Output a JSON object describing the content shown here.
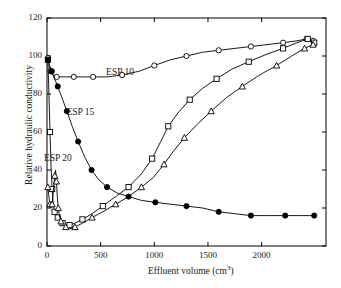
{
  "chart_data": {
    "type": "line",
    "title": "",
    "xlabel": "Effluent volume (cm3)",
    "xlabel_parts": {
      "base": "Effluent volume (cm",
      "sup": "3",
      "tail": ")"
    },
    "ylabel": "Relative hydraulic conductivity",
    "xlim": [
      0,
      2600
    ],
    "ylim": [
      0,
      120
    ],
    "xticks": [
      0,
      500,
      1000,
      1500,
      2000
    ],
    "xtick_labels": [
      "0",
      "500",
      "1000",
      "1500",
      "2000"
    ],
    "yticks": [
      0,
      20,
      40,
      60,
      80,
      100,
      120
    ],
    "ytick_labels": [
      "0",
      "20",
      "40",
      "60",
      "80",
      "100",
      "120"
    ],
    "grid": false,
    "legend_position": "inline-annotations",
    "annotations": [
      {
        "text": "ESP 10",
        "x": 700,
        "y": 91
      },
      {
        "text": "ESP 15",
        "x": 330,
        "y": 70
      },
      {
        "text": "ESP 20",
        "x": 120,
        "y": 46
      }
    ],
    "series": [
      {
        "name": "ESP 10",
        "marker": "circle-open",
        "points": [
          [
            10,
            99
          ],
          [
            20,
            95
          ],
          [
            32,
            92
          ],
          [
            55,
            90
          ],
          [
            90,
            89
          ],
          [
            150,
            89
          ],
          [
            250,
            89
          ],
          [
            340,
            89
          ],
          [
            430,
            89
          ],
          [
            560,
            89
          ],
          [
            700,
            90
          ],
          [
            860,
            92
          ],
          [
            1000,
            95
          ],
          [
            1150,
            98
          ],
          [
            1300,
            100
          ],
          [
            1450,
            102
          ],
          [
            1600,
            103
          ],
          [
            1750,
            104
          ],
          [
            1900,
            105
          ],
          [
            2050,
            106
          ],
          [
            2200,
            107
          ],
          [
            2330,
            108
          ],
          [
            2420,
            109
          ],
          [
            2480,
            108
          ]
        ]
      },
      {
        "name": "ESP 15",
        "marker": "square-open",
        "points": [
          [
            8,
            98
          ],
          [
            18,
            80
          ],
          [
            28,
            60
          ],
          [
            38,
            42
          ],
          [
            48,
            30
          ],
          [
            58,
            22
          ],
          [
            70,
            18
          ],
          [
            85,
            16
          ],
          [
            100,
            15
          ],
          [
            120,
            14
          ],
          [
            145,
            12
          ],
          [
            175,
            11
          ],
          [
            210,
            11
          ],
          [
            260,
            12
          ],
          [
            330,
            14
          ],
          [
            420,
            17
          ],
          [
            520,
            21
          ],
          [
            640,
            26
          ],
          [
            760,
            31
          ],
          [
            880,
            38
          ],
          [
            980,
            46
          ],
          [
            1060,
            55
          ],
          [
            1130,
            63
          ],
          [
            1220,
            70
          ],
          [
            1330,
            77
          ],
          [
            1450,
            83
          ],
          [
            1580,
            88
          ],
          [
            1720,
            93
          ],
          [
            1880,
            97
          ],
          [
            2050,
            101
          ],
          [
            2200,
            104
          ],
          [
            2330,
            107
          ],
          [
            2430,
            109
          ],
          [
            2490,
            107
          ]
        ]
      },
      {
        "name": "ESP 20",
        "marker": "triangle-open",
        "points": [
          [
            8,
            31
          ],
          [
            16,
            27
          ],
          [
            26,
            22
          ],
          [
            36,
            20
          ],
          [
            48,
            22
          ],
          [
            60,
            30
          ],
          [
            72,
            37
          ],
          [
            80,
            40
          ],
          [
            88,
            34
          ],
          [
            96,
            26
          ],
          [
            105,
            20
          ],
          [
            115,
            16
          ],
          [
            130,
            13
          ],
          [
            150,
            11
          ],
          [
            175,
            10
          ],
          [
            210,
            9
          ],
          [
            260,
            10
          ],
          [
            330,
            12
          ],
          [
            420,
            15
          ],
          [
            520,
            18
          ],
          [
            640,
            22
          ],
          [
            760,
            26
          ],
          [
            880,
            31
          ],
          [
            990,
            36
          ],
          [
            1090,
            43
          ],
          [
            1180,
            50
          ],
          [
            1280,
            57
          ],
          [
            1400,
            64
          ],
          [
            1530,
            71
          ],
          [
            1670,
            78
          ],
          [
            1820,
            84
          ],
          [
            1980,
            90
          ],
          [
            2140,
            95
          ],
          [
            2280,
            100
          ],
          [
            2400,
            104
          ],
          [
            2480,
            106
          ]
        ]
      },
      {
        "name": "filled-circle decline",
        "marker": "circle-filled",
        "points": [
          [
            10,
            98
          ],
          [
            25,
            95
          ],
          [
            45,
            92
          ],
          [
            70,
            88
          ],
          [
            100,
            84
          ],
          [
            140,
            78
          ],
          [
            185,
            71
          ],
          [
            235,
            63
          ],
          [
            290,
            55
          ],
          [
            350,
            47
          ],
          [
            415,
            40
          ],
          [
            480,
            35
          ],
          [
            560,
            31
          ],
          [
            650,
            28
          ],
          [
            760,
            26
          ],
          [
            880,
            24
          ],
          [
            1010,
            23
          ],
          [
            1150,
            22
          ],
          [
            1300,
            21
          ],
          [
            1450,
            20
          ],
          [
            1600,
            18
          ],
          [
            1750,
            17
          ],
          [
            1900,
            16
          ],
          [
            2060,
            16
          ],
          [
            2220,
            16
          ],
          [
            2380,
            16
          ],
          [
            2490,
            16
          ]
        ]
      }
    ]
  }
}
